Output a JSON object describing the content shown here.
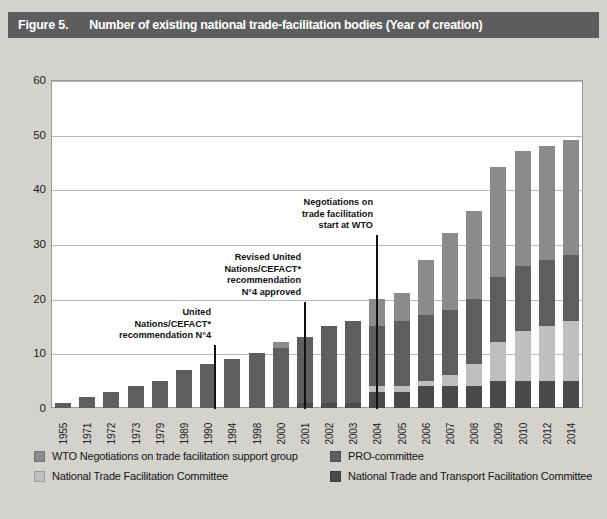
{
  "header": {
    "figure_number": "Figure 5.",
    "title": "Number of existing national trade-facilitation bodies (Year of creation)"
  },
  "colors": {
    "background": "#d4d2cd",
    "title_bar": "#5d5d5d",
    "plot_background": "#ffffff",
    "gridline": "#b9b9b9",
    "wto_negotiations": "#8b8b8b",
    "pro_committee": "#5e5e5e",
    "national_trade_facilitation": "#bfbfbf",
    "national_trade_transport": "#4a4a4a",
    "annotation_text": "#111111"
  },
  "legend": {
    "items": [
      {
        "label": "WTO Negotiations on trade facilitation support group",
        "color": "#8b8b8b",
        "column": "left",
        "row": 1
      },
      {
        "label": "National Trade Facilitation Committee",
        "color": "#bfbfbf",
        "column": "left",
        "row": 2
      },
      {
        "label": "PRO-committee",
        "color": "#5e5e5e",
        "column": "right",
        "row": 1
      },
      {
        "label": "National Trade and Transport Facilitation Committee",
        "color": "#4a4a4a",
        "column": "right",
        "row": 2
      }
    ]
  },
  "annotations": [
    {
      "id": "annotation-cefact-rec4",
      "text": "United\nNations/CEFACT*\nrecommendation N°4",
      "year": "1973",
      "text_right_px": 203,
      "text_top_px": 307,
      "line_x_px": 206,
      "line_top_px": 345,
      "line_bottom_px": 409
    },
    {
      "id": "annotation-cefact-rec4-revised",
      "text": "Revised United\nNations/CEFACT*\nrecommendation\nN°4 approved",
      "year": "2001",
      "text_right_px": 293,
      "text_top_px": 252,
      "line_x_px": 296,
      "line_top_px": 302,
      "line_bottom_px": 409
    },
    {
      "id": "annotation-wto-negotiations-start",
      "text": "Negotiations on\ntrade facilitation\nstart at WTO",
      "year": "2004",
      "text_right_px": 365,
      "text_top_px": 197,
      "line_x_px": 368,
      "line_top_px": 235,
      "line_bottom_px": 409
    }
  ],
  "chart_data": {
    "type": "bar",
    "subtype": "stacked",
    "title": "Number of existing national trade-facilitation bodies (Year of creation)",
    "xlabel": "",
    "ylabel": "",
    "ylim": [
      0,
      60
    ],
    "yticks": [
      0,
      10,
      20,
      30,
      40,
      50,
      60
    ],
    "grid": true,
    "legend_position": "bottom",
    "categories": [
      "1955",
      "1971",
      "1972",
      "1973",
      "1979",
      "1989",
      "1990",
      "1994",
      "1998",
      "2000",
      "2001",
      "2002",
      "2003",
      "2004",
      "2005",
      "2006",
      "2007",
      "2008",
      "2009",
      "2010",
      "2012",
      "2014"
    ],
    "series": [
      {
        "name": "National Trade and Transport Facilitation Committee",
        "color": "#4a4a4a",
        "stack_order": 1,
        "values": [
          0,
          0,
          0,
          0,
          0,
          0,
          0,
          0,
          0,
          0,
          1,
          1,
          1,
          3,
          3,
          4,
          4,
          4,
          5,
          5,
          5,
          5
        ]
      },
      {
        "name": "National Trade Facilitation Committee",
        "color": "#bfbfbf",
        "stack_order": 2,
        "values": [
          0,
          0,
          0,
          0,
          0,
          0,
          0,
          0,
          0,
          0,
          0,
          0,
          0,
          1,
          1,
          1,
          2,
          4,
          7,
          9,
          10,
          11
        ]
      },
      {
        "name": "PRO-committee",
        "color": "#5e5e5e",
        "stack_order": 3,
        "values": [
          1,
          2,
          3,
          4,
          5,
          7,
          8,
          9,
          10,
          11,
          12,
          14,
          15,
          11,
          12,
          12,
          12,
          12,
          12,
          12,
          12,
          12
        ]
      },
      {
        "name": "WTO Negotiations on trade facilitation support group",
        "color": "#8b8b8b",
        "stack_order": 4,
        "values": [
          0,
          0,
          0,
          0,
          0,
          0,
          0,
          0,
          0,
          1,
          0,
          0,
          0,
          5,
          5,
          10,
          14,
          16,
          20,
          21,
          21,
          21
        ]
      }
    ],
    "totals": [
      1,
      2,
      3,
      4,
      5,
      7,
      8,
      9,
      10,
      12,
      13,
      15,
      16,
      20,
      21,
      27,
      32,
      36,
      44,
      47,
      48,
      49
    ]
  }
}
